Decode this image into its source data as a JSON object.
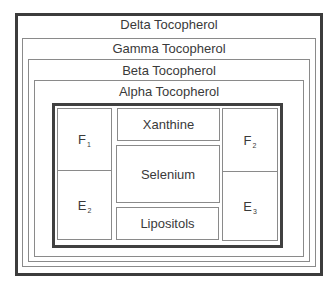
{
  "diagram": {
    "layers": [
      {
        "id": "delta",
        "label": "Delta Tocopherol"
      },
      {
        "id": "gamma",
        "label": "Gamma Tocopherol"
      },
      {
        "id": "beta",
        "label": "Beta Tocopherol"
      },
      {
        "id": "alpha",
        "label": "Alpha Tocopherol"
      }
    ],
    "core": {
      "left": [
        {
          "id": "f1",
          "letter": "F",
          "sub": "1"
        },
        {
          "id": "e2",
          "letter": "E",
          "sub": "2"
        }
      ],
      "center": [
        {
          "id": "xanthine",
          "label": "Xanthine"
        },
        {
          "id": "selenium",
          "label": "Selenium"
        },
        {
          "id": "lipositols",
          "label": "Lipositols"
        }
      ],
      "right": [
        {
          "id": "f2",
          "letter": "F",
          "sub": "2"
        },
        {
          "id": "e3",
          "letter": "E",
          "sub": "3"
        }
      ]
    },
    "colors": {
      "thick_border": "#3c3c3c",
      "thin_border": "#8a8a8a",
      "text": "#3a3a3a",
      "background": "#ffffff"
    }
  }
}
